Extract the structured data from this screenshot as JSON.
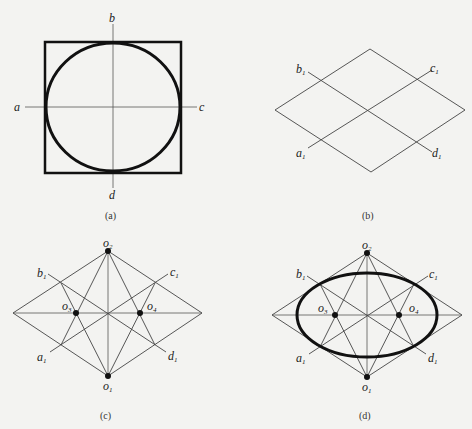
{
  "figure": {
    "panels": [
      {
        "id": "a",
        "caption": "(a)",
        "labels": {
          "top": "b",
          "left": "a",
          "right": "c",
          "bottom": "d"
        }
      },
      {
        "id": "b",
        "caption": "(b)",
        "labels": {
          "b1": "b",
          "c1": "c",
          "a1": "a",
          "d1": "d",
          "sub": "1"
        }
      },
      {
        "id": "c",
        "caption": "(c)",
        "labels": {
          "o2": "o",
          "o2_sub": "2",
          "o1": "o",
          "o1_sub": "1",
          "o3": "o",
          "o3_sub": "3",
          "o4": "o",
          "o4_sub": "4",
          "b1": "b",
          "c1": "c",
          "a1": "a",
          "d1": "d",
          "sub": "1"
        }
      },
      {
        "id": "d",
        "caption": "(d)",
        "labels": {
          "o2": "o",
          "o2_sub": "2",
          "o1": "o",
          "o1_sub": "1",
          "o3": "o",
          "o3_sub": "3",
          "o4": "o",
          "o4_sub": "4",
          "b1": "b",
          "c1": "c",
          "a1": "a",
          "d1": "d",
          "sub": "1"
        }
      }
    ],
    "colors": {
      "background": "#f3f3f1",
      "line": "#111111"
    }
  }
}
